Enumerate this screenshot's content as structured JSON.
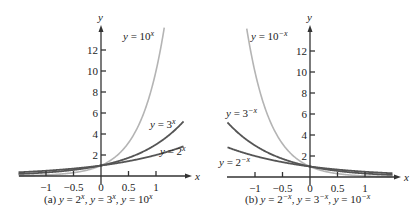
{
  "chart_data": [
    {
      "type": "line",
      "title": "(a) y = 2^x, y = 3^x, y = 10^x",
      "caption": {
        "prefix": "(a)",
        "parts": [
          "y = 2",
          "x",
          ", y = 3",
          "x",
          ", y = 10",
          "x"
        ]
      },
      "xlabel": "x",
      "ylabel": "y",
      "xlim": [
        -1.5,
        1.55
      ],
      "ylim": [
        0,
        14
      ],
      "x_ticks": [
        -1,
        -0.5,
        0,
        0.5,
        1
      ],
      "x_tick_labels": [
        "−1",
        "−0.5",
        "0",
        "0.5",
        "1"
      ],
      "y_ticks": [
        2,
        4,
        6,
        8,
        10,
        12
      ],
      "y_tick_labels": [
        "2",
        "4",
        "6",
        "8",
        "10",
        "12"
      ],
      "grid": false,
      "series": [
        {
          "name": "y = 2^x",
          "base": 2,
          "sign": 1,
          "color": "#555555",
          "label": {
            "text": "y = 2",
            "sup": "x"
          },
          "x": [
            -1.5,
            -1,
            -0.5,
            0,
            0.5,
            1,
            1.5
          ],
          "values": [
            0.35,
            0.5,
            0.71,
            1,
            1.41,
            2,
            2.83
          ]
        },
        {
          "name": "y = 3^x",
          "base": 3,
          "sign": 1,
          "color": "#555555",
          "label": {
            "text": "y = 3",
            "sup": "x"
          },
          "x": [
            -1.5,
            -1,
            -0.5,
            0,
            0.5,
            1,
            1.5
          ],
          "values": [
            0.19,
            0.33,
            0.58,
            1,
            1.73,
            3,
            5.2
          ]
        },
        {
          "name": "y = 10^x",
          "base": 10,
          "sign": 1,
          "color": "#b4b4b4",
          "label": {
            "text": "y = 10",
            "sup": "x"
          },
          "x": [
            -1.5,
            -1,
            -0.5,
            0,
            0.5,
            1,
            1.15
          ],
          "values": [
            0.03,
            0.1,
            0.32,
            1,
            3.16,
            10,
            14.1
          ]
        }
      ]
    },
    {
      "type": "line",
      "title": "(b) y = 2^-x, y = 3^-x, y = 10^-x",
      "caption": {
        "prefix": "(b)",
        "parts": [
          "y = 2",
          "−x",
          ", y = 3",
          "−x",
          ", y = 10",
          "−x"
        ]
      },
      "xlabel": "x",
      "ylabel": "y",
      "xlim": [
        -1.5,
        1.55
      ],
      "ylim": [
        0,
        14
      ],
      "x_ticks": [
        -1,
        -0.5,
        0,
        0.5,
        1
      ],
      "x_tick_labels": [
        "−1",
        "−0.5",
        "0",
        "0.5",
        "1"
      ],
      "y_ticks": [
        2,
        4,
        6,
        8,
        10,
        12
      ],
      "y_tick_labels": [
        "2",
        "4",
        "6",
        "8",
        "10",
        "12"
      ],
      "grid": false,
      "series": [
        {
          "name": "y = 2^-x",
          "base": 2,
          "sign": -1,
          "color": "#555555",
          "label": {
            "text": "y = 2",
            "sup": "−x"
          },
          "x": [
            -1.5,
            -1,
            -0.5,
            0,
            0.5,
            1,
            1.5
          ],
          "values": [
            2.83,
            2,
            1.41,
            1,
            0.71,
            0.5,
            0.35
          ]
        },
        {
          "name": "y = 3^-x",
          "base": 3,
          "sign": -1,
          "color": "#555555",
          "label": {
            "text": "y = 3",
            "sup": "−x"
          },
          "x": [
            -1.5,
            -1,
            -0.5,
            0,
            0.5,
            1,
            1.5
          ],
          "values": [
            5.2,
            3,
            1.73,
            1,
            0.58,
            0.33,
            0.19
          ]
        },
        {
          "name": "y = 10^-x",
          "base": 10,
          "sign": -1,
          "color": "#b4b4b4",
          "label": {
            "text": "y = 10",
            "sup": "−x"
          },
          "x": [
            -1.15,
            -1,
            -0.5,
            0,
            0.5,
            1,
            1.5
          ],
          "values": [
            14.1,
            10,
            3.16,
            1,
            0.32,
            0.1,
            0.03
          ]
        }
      ]
    }
  ]
}
